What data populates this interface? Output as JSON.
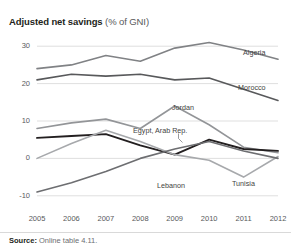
{
  "title": {
    "main": "Adjusted net savings",
    "sub": "(% of GNI)"
  },
  "source": {
    "label": "Source:",
    "text": "Online table 4.11."
  },
  "chart_data": {
    "type": "line",
    "title": "Adjusted net savings (% of GNI)",
    "xlabel": "",
    "ylabel": "% of GNI",
    "x": [
      2005,
      2006,
      2007,
      2008,
      2009,
      2010,
      2011,
      2012
    ],
    "categories": [
      "2005",
      "2006",
      "2007",
      "2008",
      "2009",
      "2010",
      "2011",
      "2012"
    ],
    "xticklabels": [
      "2005",
      "2006",
      "2007",
      "2008",
      "2009",
      "2010",
      "2011",
      "2012"
    ],
    "yticks": [
      -10,
      0,
      10,
      20,
      30
    ],
    "yticklabels": [
      "-10",
      "0",
      "10",
      "20",
      "30"
    ],
    "ylim": [
      -13,
      33
    ],
    "grid": "horizontal",
    "legend": "inline-labels",
    "series": [
      {
        "name": "Algeria",
        "color": "#808285",
        "width": 1.6,
        "values": [
          24.0,
          25.0,
          27.5,
          26.0,
          29.5,
          31.0,
          29.0,
          26.5
        ],
        "label_x": 2012,
        "label_y": 27.5
      },
      {
        "name": "Morocco",
        "color": "#58595b",
        "width": 1.6,
        "values": [
          21.0,
          22.5,
          22.0,
          22.5,
          21.0,
          21.5,
          18.5,
          15.5
        ],
        "label_x": 2012,
        "label_y": 19.5
      },
      {
        "name": "Jordan",
        "color": "#939598",
        "width": 1.6,
        "values": [
          8.0,
          9.5,
          10.5,
          8.0,
          14.0,
          9.0,
          3.0,
          1.5
        ],
        "label_x": 2009,
        "label_y": 15.5
      },
      {
        "name": "Egypt, Arab Rep.",
        "color": "#231f20",
        "width": 1.9,
        "values": [
          5.5,
          6.0,
          6.5,
          3.5,
          1.0,
          5.0,
          2.5,
          2.0
        ],
        "label_x": 2008,
        "label_y": 8.0
      },
      {
        "name": "Lebanon",
        "color": "#a7a9ac",
        "width": 1.6,
        "values": [
          0.0,
          4.0,
          7.5,
          4.5,
          1.0,
          -0.5,
          -5.0,
          0.5
        ],
        "label_x": 2008,
        "label_y": -4.5
      },
      {
        "name": "Tunisia",
        "color": "#6d6e71",
        "width": 1.6,
        "values": [
          -9.0,
          -6.5,
          -3.5,
          0.0,
          2.5,
          4.5,
          2.0,
          0.0
        ],
        "label_x": 2011,
        "label_y": -4.0
      }
    ]
  }
}
